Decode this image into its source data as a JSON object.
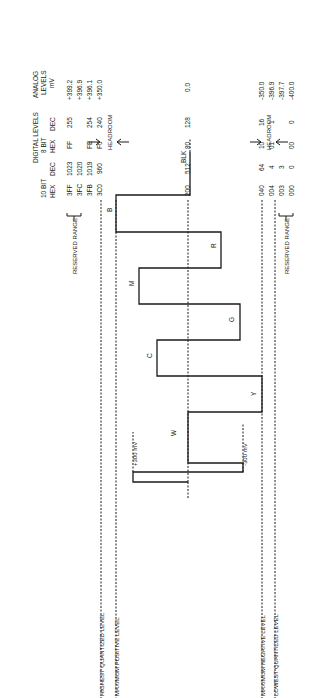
{
  "header": {
    "analog_title": [
      "ANALOG",
      "LEVELS",
      "mV"
    ],
    "digital_title": "DIGITAL LEVELS",
    "bit8_label": "8 BIT",
    "bit10_label": "10 BIT",
    "col_dec_8": "DEC",
    "col_hex_8": "HEX",
    "col_dec_10": "DEC",
    "col_hex_10": "HEX"
  },
  "rows": [
    {
      "mv": "+399.2",
      "dec8": "255",
      "hex8": "FF",
      "dec10": "1023",
      "hex10": "3FF"
    },
    {
      "mv": "+396.9",
      "dec8": "",
      "hex8": "",
      "dec10": "1020",
      "hex10": "3FC"
    },
    {
      "mv": "+396.1",
      "dec8": "254",
      "hex8": "FE",
      "dec10": "1019",
      "hex10": "3FB"
    },
    {
      "mv": "+350.0",
      "dec8": "240",
      "hex8": "F0",
      "dec10": "960",
      "hex10": "3C0"
    },
    {
      "mv": "0.0",
      "dec8": "128",
      "hex8": "80",
      "dec10": "512",
      "hex10": "200"
    },
    {
      "mv": "-350.0",
      "dec8": "16",
      "hex8": "10",
      "dec10": "64",
      "hex10": "040"
    },
    {
      "mv": "-396.9",
      "dec8": "1",
      "hex8": "01",
      "dec10": "4",
      "hex10": "004"
    },
    {
      "mv": "-397.7",
      "dec8": "",
      "hex8": "",
      "dec10": "3",
      "hex10": "003"
    },
    {
      "mv": "-400.0",
      "dec8": "0",
      "hex8": "00",
      "dec10": "0",
      "hex10": "000"
    }
  ],
  "annotations": {
    "reserved_top": "RESERVED RANGE",
    "reserved_bottom": "RESERVED RANGE",
    "plus300": "+300 mV",
    "minus300": "-300 mV",
    "headroom_top": "HEADROOM",
    "headroom_bottom": "HEADROOM"
  },
  "level_labels": {
    "highest_quantized": "HIGHEST QUANTIZED LEVEL",
    "max_positive": "MAXIMUM POSITIVE LEVEL",
    "blanking": "BLANKING  LEVEL",
    "max_negative": "MAXIMUM NEGATIVE LEVEL",
    "lowest_quantized": "LOWEST QUANTIZED LEVEL"
  },
  "bars": {
    "W": "W",
    "Y": "Y",
    "C": "C",
    "G": "G",
    "M": "M",
    "R": "R",
    "B": "B",
    "BLK": "BLK"
  }
}
